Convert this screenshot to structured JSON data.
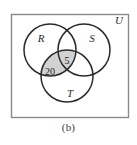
{
  "figure": {
    "caption": "(b)",
    "universe_label": "U",
    "background_color": "#ffffff",
    "border_color": "#8a8a8a",
    "circle_stroke_color": "#2b2b2b",
    "shade_color": "#d2d2d2"
  },
  "sets": [
    {
      "id": "R",
      "label": "R",
      "cx": 50,
      "cy": 50,
      "r": 26
    },
    {
      "id": "S",
      "label": "S",
      "cx": 84,
      "cy": 50,
      "r": 26
    },
    {
      "id": "T",
      "label": "T",
      "cx": 67,
      "cy": 76,
      "r": 26
    }
  ],
  "universe": {
    "x": 11,
    "y": 14,
    "width": 117,
    "height": 103
  },
  "region_values": [
    {
      "region": "R-and-T-only",
      "value": "20",
      "x": 50,
      "y": 72
    },
    {
      "region": "R-and-S-and-T",
      "value": "5",
      "x": 67,
      "y": 61
    }
  ],
  "label_positions": {
    "R": {
      "x": 41,
      "y": 42
    },
    "S": {
      "x": 92,
      "y": 42
    },
    "T": {
      "x": 70,
      "y": 97
    },
    "U": {
      "x": 119,
      "y": 24
    }
  },
  "chart_data": {
    "type": "diagram",
    "diagram_type": "venn",
    "set_count": 3,
    "sets": [
      "R",
      "S",
      "T"
    ],
    "universe": "U",
    "shaded_regions": [
      "R∩T",
      "R∩S∩T"
    ],
    "labeled_regions": [
      {
        "region": "R∩T (excluding S)",
        "label": "20"
      },
      {
        "region": "R∩S∩T",
        "label": "5"
      }
    ],
    "title": "(b)"
  }
}
